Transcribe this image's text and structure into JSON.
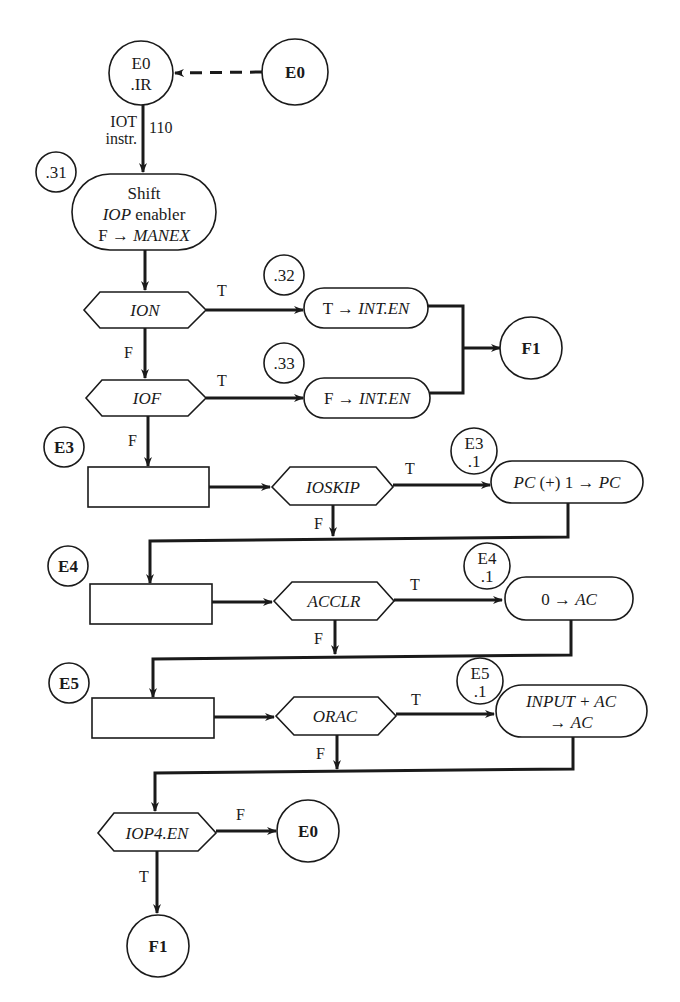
{
  "diagram": {
    "type": "flowchart",
    "colors": {
      "stroke": "#1a1a1a",
      "background": "#ffffff"
    },
    "nodes": {
      "e0_ir": {
        "line1": "E0",
        "line2": ".IR"
      },
      "e0_top": {
        "label": "E0"
      },
      "ref_31": {
        "label": ".31"
      },
      "shift_box": {
        "line1": "Shift",
        "line2_italic": "IOP",
        "line2_rest": " enabler",
        "line3_prefix": "F → ",
        "line3_italic": "MANEX"
      },
      "ion": {
        "label": "ION"
      },
      "iof": {
        "label": "IOF"
      },
      "ref_32": {
        "label": ".32"
      },
      "ref_33": {
        "label": ".33"
      },
      "t_int_en": {
        "prefix": "T → ",
        "italic": "INT.EN"
      },
      "f_int_en": {
        "prefix": "F → ",
        "italic": "INT.EN"
      },
      "f1_mid": {
        "label": "F1"
      },
      "e3": {
        "label": "E3"
      },
      "ioskip": {
        "label": "IOSKIP"
      },
      "e3_1": {
        "line1": "E3",
        "line2": ".1"
      },
      "pc_inc": {
        "italic1": "PC",
        "mid": " (+) 1 → ",
        "italic2": "PC"
      },
      "e4": {
        "label": "E4"
      },
      "acclr": {
        "label": "ACCLR"
      },
      "e4_1": {
        "line1": "E4",
        "line2": ".1"
      },
      "zero_ac": {
        "prefix": "0 → ",
        "italic": "AC"
      },
      "e5": {
        "label": "E5"
      },
      "orac": {
        "label": "ORAC"
      },
      "e5_1": {
        "line1": "E5",
        "line2": ".1"
      },
      "input_ac": {
        "line1": "INPUT + AC",
        "line2_prefix": "→ ",
        "line2_italic": "AC"
      },
      "iop4_en": {
        "label": "IOP4.EN"
      },
      "e0_bottom": {
        "label": "E0"
      },
      "f1_bottom": {
        "label": "F1"
      }
    },
    "edge_labels": {
      "iot": "IOT",
      "instr": "instr.",
      "code_110": "110",
      "ion_true": "T",
      "ion_false": "F",
      "iof_true": "T",
      "iof_false": "F",
      "ioskip_true": "T",
      "ioskip_false": "F",
      "acclr_true": "T",
      "acclr_false": "F",
      "orac_true": "T",
      "orac_false": "F",
      "iop4_false": "F",
      "iop4_true": "T"
    }
  }
}
